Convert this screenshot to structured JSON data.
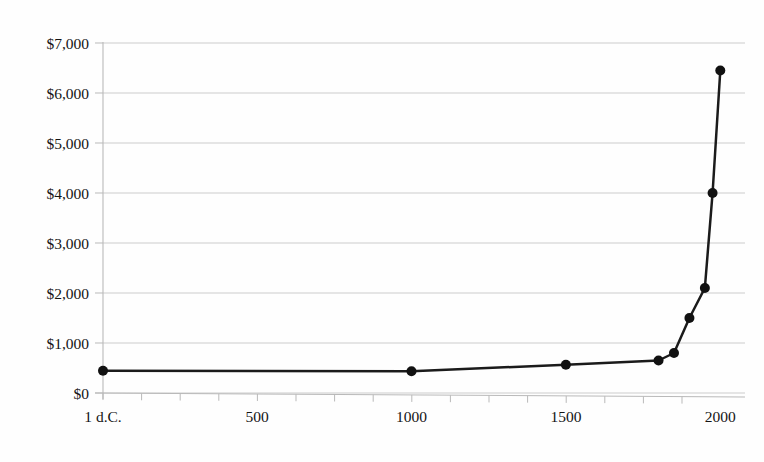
{
  "chart_data": {
    "type": "line",
    "title": "",
    "subtitle": "",
    "xlabel": "",
    "ylabel": "",
    "x": [
      1,
      1000,
      1500,
      1800,
      1850,
      1900,
      1950,
      1975,
      2000
    ],
    "values": [
      445,
      435,
      565,
      650,
      800,
      1500,
      2100,
      4000,
      6450
    ],
    "series": [
      {
        "name": "GDP per capita",
        "values": [
          445,
          435,
          565,
          650,
          800,
          1500,
          2100,
          4000,
          6450
        ]
      }
    ],
    "xlim": [
      1,
      2080
    ],
    "ylim": [
      0,
      7000
    ],
    "x_tick_values": [
      1,
      500,
      1000,
      1500,
      2000
    ],
    "x_tick_labels": [
      "1 d.C.",
      "500",
      "1000",
      "1500",
      "2000"
    ],
    "x_minor_tick_step": 125,
    "y_tick_values": [
      0,
      1000,
      2000,
      3000,
      4000,
      5000,
      6000,
      7000
    ],
    "y_tick_labels": [
      "$0",
      "$1,000",
      "$2,000",
      "$3,000",
      "$4,000",
      "$5,000",
      "$6,000",
      "$7,000"
    ],
    "grid": true,
    "grid_axis": "y",
    "legend": false,
    "legend_position": "none",
    "marker": "circle",
    "marker_size": 5,
    "line_color": "#1b1b1b",
    "grid_color": "#c7c7c7",
    "axis_color": "#b9b9b9",
    "background_color": "#fefefe",
    "annotations": []
  },
  "axes": {
    "y_axis_name": "y-axis",
    "x_axis_name": "x-axis"
  }
}
